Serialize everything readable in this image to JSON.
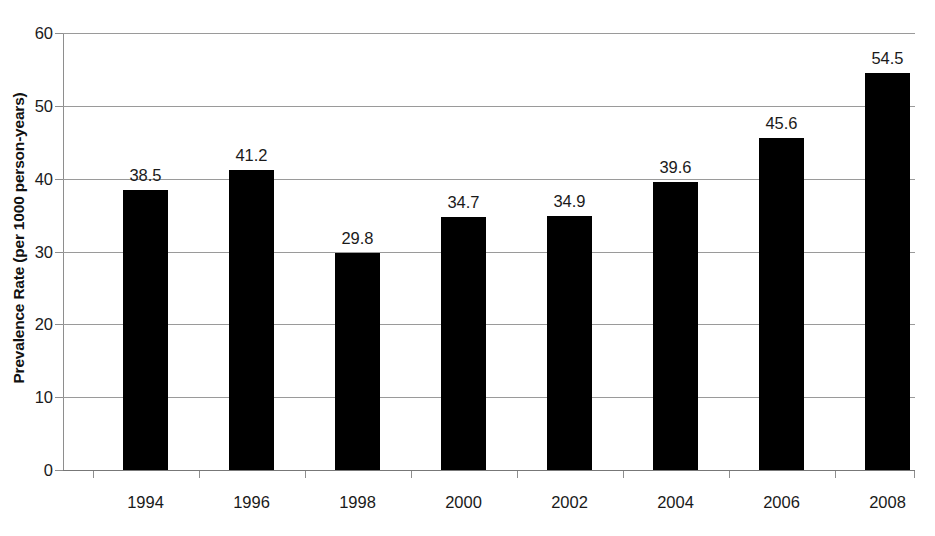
{
  "chart_data": {
    "type": "bar",
    "title": "",
    "subtitle": "",
    "xlabel": "",
    "ylabel": "Prevalence Rate (per 1000 person-years)",
    "categories": [
      "1994",
      "1996",
      "1998",
      "2000",
      "2002",
      "2004",
      "2006",
      "2008"
    ],
    "values": [
      38.5,
      41.2,
      29.8,
      34.7,
      34.9,
      39.6,
      45.6,
      54.5
    ],
    "value_labels": [
      "38.5",
      "41.2",
      "29.8",
      "34.7",
      "34.9",
      "39.6",
      "45.6",
      "54.5"
    ],
    "ylim": [
      0,
      60
    ],
    "ytick_values": [
      0,
      10,
      20,
      30,
      40,
      50,
      60
    ],
    "ytick_labels": [
      "0",
      "10",
      "20",
      "30",
      "40",
      "50",
      "60"
    ],
    "grid": true,
    "grid_axis": "y",
    "legend": false,
    "legend_position": "none",
    "bar_color": "#000000",
    "gridline_color": "#9a9a9a",
    "axis_color": "#8e8e8e",
    "background_color": "#ffffff",
    "text_color": "#1a1a1a"
  }
}
